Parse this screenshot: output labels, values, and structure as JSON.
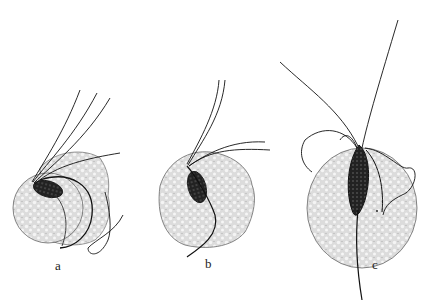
{
  "figure": {
    "panels": [
      {
        "label": "a",
        "description": "flagellate attached to spherical cell, flagella sweeping up-right, undulating membrane curving around cell"
      },
      {
        "label": "b",
        "description": "flagellate attached to spherical cell, flagella upward, trailing axostyle downward-left"
      },
      {
        "label": "c",
        "description": "elongated flagellate on spherical cell, long flagella upward and left, axostyle extending below"
      }
    ],
    "colors": {
      "ink": "#1a1a1a",
      "stipple": "#9a9a9a",
      "cell_fill": "#e4e4e4",
      "background": "#ffffff"
    }
  }
}
